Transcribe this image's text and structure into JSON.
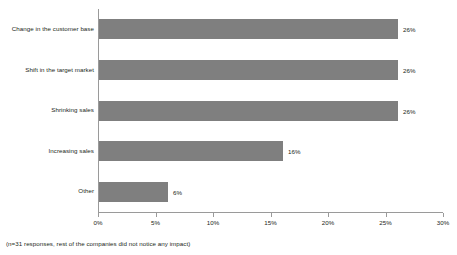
{
  "chart_data": {
    "type": "bar",
    "orientation": "horizontal",
    "title": "",
    "subtitle": "",
    "xlabel": "",
    "ylabel": "",
    "categories": [
      "Change in the customer base",
      "Shift in the target market",
      "Shrinking sales",
      "Increasing sales",
      "Other"
    ],
    "values": [
      26,
      26,
      26,
      16,
      6
    ],
    "data_labels": [
      "26%",
      "26%",
      "26%",
      "16%",
      "6%"
    ],
    "xlim": [
      0,
      30
    ],
    "xticks": [
      0,
      5,
      10,
      15,
      20,
      25,
      30
    ],
    "xtick_labels": [
      "0%",
      "5%",
      "10%",
      "15%",
      "20%",
      "25%",
      "30%"
    ],
    "grid": false,
    "legend": false,
    "bar_color": "#7f7f7f",
    "axis_color": "#9a9a9a",
    "text_color": "#231f20",
    "background": "#ffffff"
  },
  "footnote": {
    "text": "(n=31 responses, rest of the companies did not notice any impact)"
  }
}
